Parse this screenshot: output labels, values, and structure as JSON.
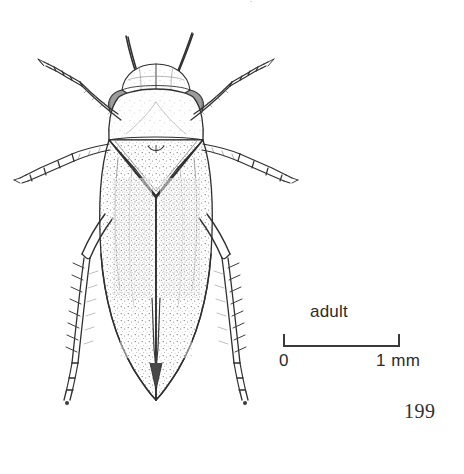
{
  "page": {
    "number": "199",
    "background_color": "#ffffff",
    "ink_color": "#2b2b2b"
  },
  "header": {
    "cropped_text": "."
  },
  "figure": {
    "name": "insect-dorsal-habitus-line-drawing",
    "style": "stippled pen and ink scientific illustration",
    "parts": [
      "antennae",
      "vertex",
      "compound-eye-left",
      "compound-eye-right",
      "pronotum",
      "mesonotum",
      "forewings",
      "foreleg-left",
      "foreleg-right",
      "midleg-left",
      "midleg-right",
      "hindleg-left",
      "hindleg-right"
    ]
  },
  "scale_bar": {
    "caption": "adult",
    "min_label": "0",
    "max_label": "1 mm",
    "length_value": 1,
    "length_unit": "mm",
    "color": "#2b2b2b"
  }
}
